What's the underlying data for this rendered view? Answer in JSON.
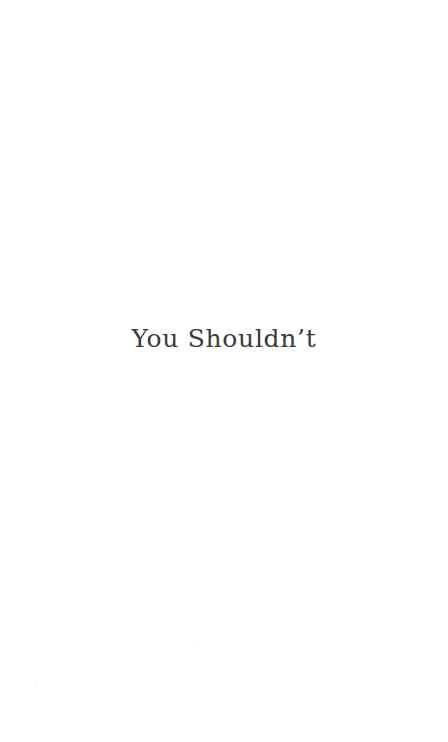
{
  "page": {
    "background_color": "#ffffff",
    "width": 448,
    "height": 742,
    "kind": "book-chapter-title-page"
  },
  "title": {
    "text": "You Shouldn’t",
    "color": "#3a3a3e",
    "alignment": "center"
  },
  "artifacts": {
    "mark_one": "",
    "mark_two": ""
  }
}
